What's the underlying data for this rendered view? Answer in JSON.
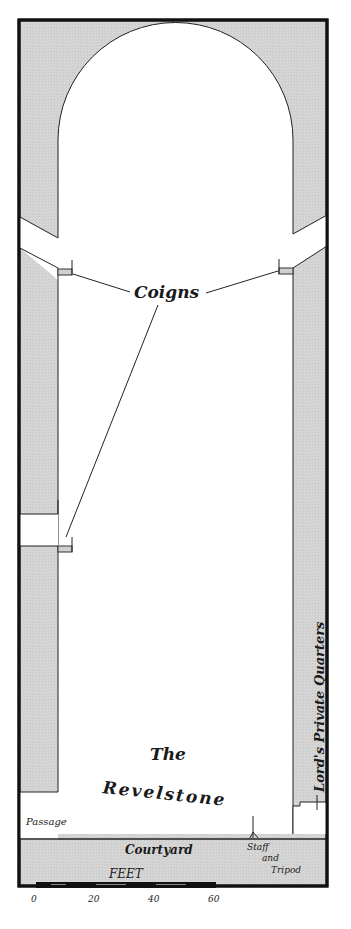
{
  "map": {
    "title_line1": "The",
    "title_line2": "Revelstone",
    "labels": {
      "coigns": "Coigns",
      "passage": "Passage",
      "courtyard": "Courtyard",
      "staff_line1": "Staff",
      "staff_line2": "and",
      "staff_line3": "Tripod",
      "lords_quarters": "Lord's Private Quarters"
    },
    "scale": {
      "unit_label": "FEET",
      "ticks": [
        "0",
        "20",
        "40",
        "60"
      ]
    },
    "colors": {
      "wall_fill": "#d4d4d4",
      "border": "#111111",
      "floor": "#ffffff"
    }
  }
}
